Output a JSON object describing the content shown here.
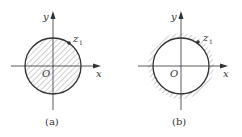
{
  "figure": {
    "panels": [
      {
        "id": "a",
        "caption": "(a)",
        "region": "interior",
        "labels": {
          "x_axis": "x",
          "y_axis": "y",
          "origin": "O",
          "point": "z",
          "point_sub": "1"
        }
      },
      {
        "id": "b",
        "caption": "(b)",
        "region": "exterior",
        "labels": {
          "x_axis": "x",
          "y_axis": "y",
          "origin": "O",
          "point": "z",
          "point_sub": "1"
        }
      }
    ],
    "colors": {
      "stroke": "#333333",
      "hatch": "#888888",
      "background": "#ffffff"
    }
  }
}
